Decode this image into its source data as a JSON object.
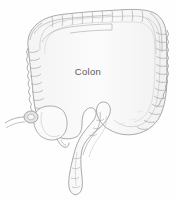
{
  "figure": {
    "kind": "anatomical-line-illustration",
    "subject": "Colon",
    "background_color": "#fefefe",
    "outline_color": "#8e8e8e",
    "inner_line_color": "#b8b8b8",
    "shading_color": "#e8e8e8",
    "width": 176,
    "height": 200
  },
  "labels": {
    "main": "Colon",
    "main_color": "#5a5a5a",
    "main_font_size": "9.5px"
  },
  "structures": [
    {
      "name": "transverse-colon",
      "position": "top"
    },
    {
      "name": "hepatic-flexure",
      "position": "top-left"
    },
    {
      "name": "splenic-flexure",
      "position": "top-right"
    },
    {
      "name": "ascending-colon",
      "position": "left"
    },
    {
      "name": "descending-colon",
      "position": "right"
    },
    {
      "name": "cecum",
      "position": "lower-left"
    },
    {
      "name": "appendix",
      "position": "lower-left"
    },
    {
      "name": "ileocecal-valve",
      "position": "lower-left"
    },
    {
      "name": "ileum",
      "position": "lower-left"
    },
    {
      "name": "sigmoid-colon",
      "position": "bottom-center"
    },
    {
      "name": "rectum",
      "position": "bottom-center"
    }
  ]
}
